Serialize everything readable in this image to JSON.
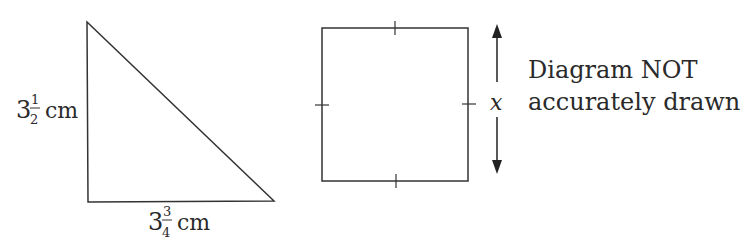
{
  "triangle": {
    "vertical_side": {
      "whole": "3",
      "num": "1",
      "den": "2",
      "unit": "cm"
    },
    "horizontal_side": {
      "whole": "3",
      "num": "3",
      "den": "4",
      "unit": "cm"
    }
  },
  "square": {
    "side_label": "x"
  },
  "note": {
    "line1": "Diagram NOT",
    "line2": "accurately drawn"
  }
}
